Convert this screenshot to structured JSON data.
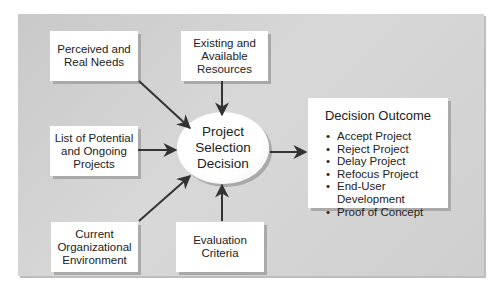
{
  "diagram": {
    "inputs": [
      {
        "id": "perceived",
        "lines": [
          "Perceived and",
          "Real Needs"
        ]
      },
      {
        "id": "existing",
        "lines": [
          "Existing and",
          "Available",
          "Resources"
        ]
      },
      {
        "id": "list",
        "lines": [
          "List of Potential",
          "and Ongoing",
          "Projects"
        ]
      },
      {
        "id": "current",
        "lines": [
          "Current",
          "Organizational",
          "Environment"
        ]
      },
      {
        "id": "evaluation",
        "lines": [
          "Evaluation",
          "Criteria"
        ]
      }
    ],
    "center": {
      "lines": [
        "Project",
        "Selection",
        "Decision"
      ]
    },
    "outcome": {
      "title": "Decision Outcome",
      "items": [
        "Accept Project",
        "Reject Project",
        "Delay Project",
        "Refocus Project",
        "End-User Development",
        "Proof of Concept"
      ]
    },
    "colors": {
      "panel": "#d0d0d0",
      "box": "#ffffff",
      "arrow": "#333333",
      "shadow": "#a9a9a9"
    }
  }
}
